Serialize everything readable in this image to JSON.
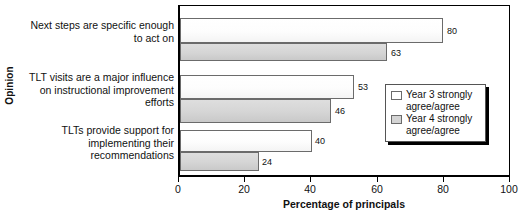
{
  "chart_data": {
    "type": "bar",
    "orientation": "horizontal",
    "title": "",
    "xlabel": "Percentage of principals",
    "ylabel": "Opinion",
    "xlim": [
      0,
      100
    ],
    "xticks": [
      0,
      20,
      40,
      60,
      80,
      100
    ],
    "grid": false,
    "legend_position": "center-right",
    "categories": [
      "Next steps are specific enough\nto act on",
      "TLT visits are a major influence\non instructional improvement\nefforts",
      "TLTs provide support for\nimplementing their\nrecommendations"
    ],
    "series": [
      {
        "name": "Year 3 strongly agree/agree",
        "color": "#ffffff",
        "values": [
          80,
          53,
          40
        ]
      },
      {
        "name": "Year 4 strongly agree/agree",
        "color": "#d4d4d4",
        "values": [
          63,
          46,
          24
        ]
      }
    ],
    "data_labels": [
      "80",
      "63",
      "53",
      "46",
      "40",
      "24"
    ]
  },
  "axis": {
    "y_title": "Opinion",
    "x_title": "Percentage of principals",
    "x_tick_labels": [
      "0",
      "20",
      "40",
      "60",
      "80",
      "100"
    ]
  },
  "categories": [
    {
      "line1": "Next steps are specific enough",
      "line2": "to act on",
      "line3": ""
    },
    {
      "line1": "TLT visits are a major influence",
      "line2": "on instructional improvement",
      "line3": "efforts"
    },
    {
      "line1": "TLTs provide support for",
      "line2": "implementing their",
      "line3": "recommendations"
    }
  ],
  "bar_values": {
    "g1s1": "80",
    "g1s2": "63",
    "g2s1": "53",
    "g2s2": "46",
    "g3s1": "40",
    "g3s2": "24"
  },
  "legend": {
    "entries": [
      {
        "line1": "Year 3 strongly",
        "line2": "agree/agree"
      },
      {
        "line1": "Year 4 strongly",
        "line2": "agree/agree"
      }
    ]
  }
}
